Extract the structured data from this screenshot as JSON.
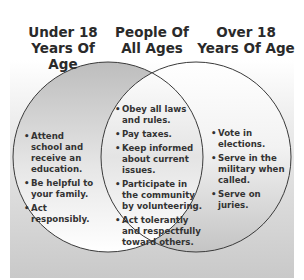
{
  "diagram": {
    "type": "venn",
    "colors": {
      "outline": "#3a3a3a",
      "text": "#333333",
      "background_top": "#ffffff",
      "background_bottom": "#c9c9c9"
    },
    "sets": [
      {
        "id": "left",
        "title_line1": "Under 18",
        "title_line2": "Years Of Age",
        "items": [
          "Attend school and receive an education.",
          "Be helpful to your family.",
          "Act responsibly."
        ]
      },
      {
        "id": "center",
        "title_line1": "People Of",
        "title_line2": "All Ages",
        "items": [
          "Obey all laws and rules.",
          "Pay taxes.",
          "Keep informed about current issues.",
          "Participate in the community by volunteering.",
          "Act tolerantly and respectfully toward others."
        ]
      },
      {
        "id": "right",
        "title_line1": "Over 18",
        "title_line2": "Years Of Age",
        "items": [
          "Vote in elections.",
          "Serve in the military when called.",
          "Serve on juries."
        ]
      }
    ]
  }
}
